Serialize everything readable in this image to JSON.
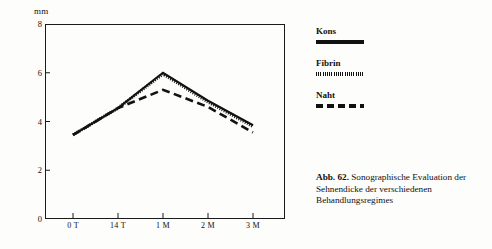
{
  "chart_data": {
    "type": "line",
    "title": "",
    "xlabel": "",
    "ylabel": "mm",
    "ylim": [
      0,
      8
    ],
    "xlim": [
      0,
      4
    ],
    "grid": false,
    "y_ticks": [
      "0",
      "2",
      "4",
      "6",
      "8"
    ],
    "y_tick_values": [
      0,
      2,
      4,
      6,
      8
    ],
    "categories": [
      "0 T",
      "14 T",
      "1 M",
      "2 M",
      "3 M"
    ],
    "series": [
      {
        "name": "Kons",
        "style": "solid",
        "values": [
          3.45,
          4.55,
          6.0,
          4.85,
          3.85
        ]
      },
      {
        "name": "Fibrin",
        "style": "dotted",
        "values": [
          3.45,
          4.55,
          5.95,
          4.8,
          3.8
        ]
      },
      {
        "name": "Naht",
        "style": "dashed",
        "values": [
          3.45,
          4.55,
          5.3,
          4.6,
          3.55
        ]
      }
    ],
    "legend_position": "right"
  },
  "axis": {
    "unit_label": "mm"
  },
  "legend": {
    "items": [
      {
        "label": "Kons",
        "style": "solid"
      },
      {
        "label": "Fibrin",
        "style": "dotted"
      },
      {
        "label": "Naht",
        "style": "dashed"
      }
    ]
  },
  "caption": {
    "figure_number": "Abb. 62.",
    "text": " Sonographische Evaluation der Sehnendicke der verschiedenen Behandlungsregimes"
  }
}
